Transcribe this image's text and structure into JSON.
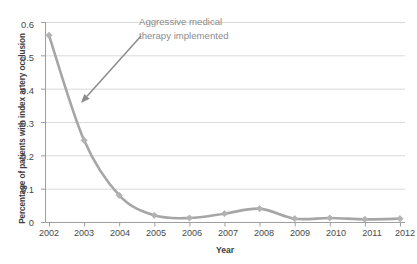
{
  "chart_data": {
    "type": "line",
    "title": "",
    "xlabel": "Year",
    "ylabel": "Percentage of patients with index artery occlusion",
    "categories": [
      "2002",
      "2003",
      "2004",
      "2005",
      "2006",
      "2007",
      "2008",
      "2009",
      "2010",
      "2011",
      "2012"
    ],
    "values": [
      0.56,
      0.245,
      0.08,
      0.02,
      0.012,
      0.025,
      0.04,
      0.01,
      0.012,
      0.008,
      0.01
    ],
    "series": [
      {
        "name": "Index artery occlusion",
        "values": [
          0.56,
          0.245,
          0.08,
          0.02,
          0.012,
          0.025,
          0.04,
          0.01,
          0.012,
          0.008,
          0.01
        ]
      }
    ],
    "ylim": [
      0,
      0.6
    ],
    "ytick_labels": [
      "0",
      "0.1",
      "0.2",
      "0.3",
      "0.4",
      "0.5",
      "0.6"
    ],
    "ytick_values": [
      0,
      0.1,
      0.2,
      0.3,
      0.4,
      0.5,
      0.6
    ],
    "xtick_labels": [
      "2002",
      "2003",
      "2004",
      "2005",
      "2006",
      "2007",
      "2008",
      "2009",
      "2010",
      "2011",
      "2012"
    ],
    "grid": "horizontal",
    "legend": "none",
    "line_color": "#a6a6a6",
    "marker": "diamond",
    "marker_color": "#b3b3b3",
    "gridline_color": "#d9d9d9",
    "axis_color": "#9e9e9e",
    "annotations": [
      {
        "text": "Aggressive medical\ntherapy implemented",
        "color": "#8c8c8c",
        "arrow": {
          "from_x": 141,
          "from_y": 36,
          "to_x": 81,
          "to_y": 103
        }
      }
    ]
  },
  "axes": {
    "y_title": "Percentage of patients with index artery occlusion",
    "x_title": "Year"
  },
  "ytick_0": "0",
  "ytick_1": "0.1",
  "ytick_2": "0.2",
  "ytick_3": "0.3",
  "ytick_4": "0.4",
  "ytick_5": "0.5",
  "ytick_6": "0.6",
  "xtick_0": "2002",
  "xtick_1": "2003",
  "xtick_2": "2004",
  "xtick_3": "2005",
  "xtick_4": "2006",
  "xtick_5": "2007",
  "xtick_6": "2008",
  "xtick_7": "2009",
  "xtick_8": "2010",
  "xtick_9": "2011",
  "xtick_10": "2012",
  "annotation_text": "Aggressive medical\ntherapy implemented"
}
